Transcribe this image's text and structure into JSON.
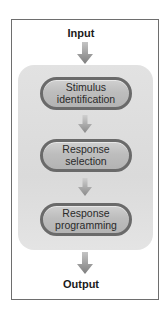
{
  "diagram": {
    "input_label": "Input",
    "output_label": "Output",
    "stages": [
      {
        "line1": "Stimulus",
        "line2": "identification"
      },
      {
        "line1": "Response",
        "line2": "selection"
      },
      {
        "line1": "Response",
        "line2": "programming"
      }
    ],
    "colors": {
      "frame_border": "#6e6e6e",
      "panel_fill": "#dedede",
      "pill_fill": "#bdbdbd",
      "pill_border": "#6a6a6a",
      "arrow": "#8c8c8c",
      "text": "#1a1a1a"
    }
  }
}
